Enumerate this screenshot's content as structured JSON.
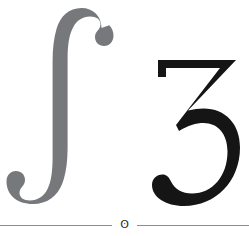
{
  "page": {
    "background_color": "#ffffff",
    "width": 249,
    "height": 236
  },
  "glyphs": [
    {
      "id": "integral",
      "character": "∫",
      "name": "integral-sign",
      "color": "#77787b",
      "position": "left"
    },
    {
      "id": "three",
      "character": "3",
      "name": "numeral-three",
      "color": "#151515",
      "position": "right"
    }
  ],
  "footer": {
    "ornament": "ʘ",
    "ornament_name": "circled-dot-ornament",
    "rule_color": "#8d8d91"
  }
}
